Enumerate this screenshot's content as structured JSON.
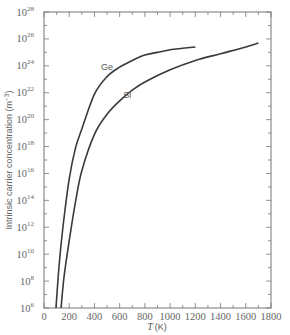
{
  "chart_data": {
    "type": "line",
    "title": "",
    "xlabel": "T (K)",
    "xlabel_var": "T",
    "xlabel_unit": "(K)",
    "ylabel": "Intrinsic carrier concentration (m^-3)",
    "ylabel_text": "Intrinsic carrier concentration (m",
    "ylabel_exp": "−3",
    "ylabel_close": ")",
    "yscale": "log",
    "xlim": [
      0,
      1800
    ],
    "ylim_log10": [
      6,
      28
    ],
    "grid": false,
    "x_ticks": [
      0,
      200,
      400,
      600,
      800,
      1000,
      1200,
      1400,
      1600,
      1800
    ],
    "x_tick_labels": [
      "0",
      "200",
      "400",
      "600",
      "800",
      "1000",
      "1200",
      "1400",
      "1600",
      "1800"
    ],
    "y_tick_exponents": [
      6,
      8,
      10,
      12,
      14,
      16,
      18,
      20,
      22,
      24,
      26,
      28
    ],
    "y_tick_base": "10",
    "series": [
      {
        "name": "Ge",
        "x": [
          95,
          120,
          150,
          200,
          250,
          300,
          400,
          500,
          600,
          700,
          800,
          900,
          1000,
          1100,
          1200
        ],
        "log10_values": [
          6.0,
          9.2,
          12.0,
          15.6,
          17.9,
          19.3,
          21.9,
          23.2,
          23.9,
          24.4,
          24.8,
          25.0,
          25.2,
          25.3,
          25.4
        ]
      },
      {
        "name": "Si",
        "x": [
          135,
          160,
          200,
          250,
          300,
          400,
          500,
          600,
          700,
          800,
          1000,
          1200,
          1400,
          1600,
          1700
        ],
        "log10_values": [
          6.0,
          8.4,
          11.0,
          13.9,
          16.2,
          18.9,
          20.4,
          21.4,
          22.2,
          22.8,
          23.7,
          24.4,
          24.9,
          25.4,
          25.7
        ]
      }
    ],
    "annotations": [
      {
        "text": "Ge",
        "x": 500,
        "log10_y": 23.7
      },
      {
        "text": "Si",
        "x": 660,
        "log10_y": 21.6
      }
    ],
    "legend": "none (inline labels)"
  },
  "colors": {
    "curve": "#3a3a3a",
    "axis": "#777777",
    "text": "#666666"
  }
}
